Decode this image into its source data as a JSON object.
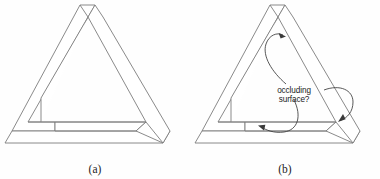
{
  "figure": {
    "background_color": "#fefefe",
    "line_color": "#7d7d7d",
    "annotation_color": "#3a3a3a",
    "width": 380,
    "height": 179
  },
  "panels": [
    {
      "id": "panel-a",
      "caption": "(a)",
      "shape_name": "penrose-triangle",
      "annotated": false
    },
    {
      "id": "panel-b",
      "caption": "(b)",
      "shape_name": "penrose-triangle",
      "annotated": true,
      "annotation": {
        "label_line_1": "occluding",
        "label_line_2": "surface?",
        "arrow_count": 3,
        "arrows": [
          {
            "name": "arrow-to-top-vertex",
            "points_to": "inner upper-left edge near apex"
          },
          {
            "name": "arrow-to-right-edge",
            "points_to": "right beam inner edge"
          },
          {
            "name": "arrow-to-bottom-left",
            "points_to": "bottom beam left inner edge"
          }
        ]
      }
    }
  ]
}
